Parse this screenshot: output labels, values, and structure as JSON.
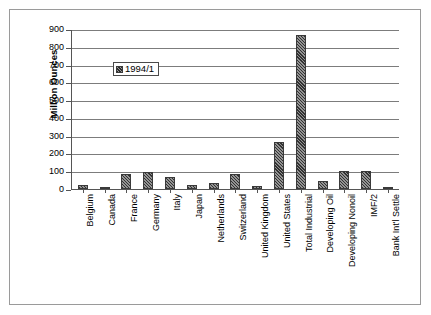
{
  "chart_data": {
    "type": "bar",
    "title": "",
    "xlabel": "",
    "ylabel": "Million Ounces",
    "ylim": [
      0,
      900
    ],
    "ytick_step": 100,
    "yticks": [
      0,
      100,
      200,
      300,
      400,
      500,
      600,
      700,
      800,
      900
    ],
    "ytick_labels": [
      "0",
      "100",
      "200",
      "300",
      "400",
      "500",
      "600",
      "700",
      "800",
      "900"
    ],
    "grid": true,
    "grid_axis": "y",
    "legend_position": "upper-left-inside",
    "categories": [
      "Belgium",
      "Canada",
      "France",
      "Germany",
      "Italy",
      "Japan",
      "Netherlands",
      "Switzerland",
      "United Kingdom",
      "United States",
      "Total Industrial",
      "Developing Oil",
      "Developing Nonoil",
      "IMF/2",
      "Bank Int'l Settle"
    ],
    "series": [
      {
        "name": "1994/1",
        "color": "#6f6f6f",
        "values": [
          25,
          4,
          82,
          96,
          67,
          24,
          35,
          83,
          18,
          262,
          866,
          43,
          100,
          104,
          4
        ]
      }
    ]
  },
  "legend": {
    "entries": [
      {
        "label": "1994/1",
        "swatch": "hatched-gray-swatch"
      }
    ]
  },
  "axes": {
    "y_title": "Million Ounces"
  }
}
